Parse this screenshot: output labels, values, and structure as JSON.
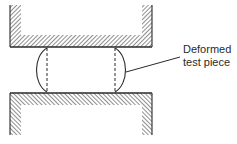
{
  "diagram": {
    "type": "compression-test-schematic",
    "label": {
      "line1": "Deformed",
      "line2": "test piece"
    },
    "components": [
      {
        "name": "upper-platen",
        "hatch": "diagonal-forward"
      },
      {
        "name": "lower-platen",
        "hatch": "diagonal-backward"
      },
      {
        "name": "deformed-test-piece",
        "shape": "barrel",
        "original_outline": "dashed"
      }
    ],
    "colors": {
      "stroke": "#2a2a2a",
      "background": "#ffffff"
    }
  }
}
